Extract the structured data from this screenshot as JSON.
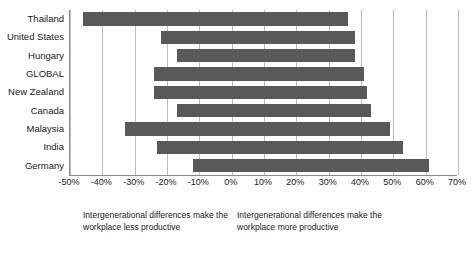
{
  "chart_data": {
    "type": "bar",
    "orientation": "horizontal",
    "title": "",
    "xlabel": "",
    "ylabel": "",
    "xlim": [
      -50,
      70
    ],
    "xtick_step": 10,
    "grid": true,
    "legend": "none",
    "bar_color": "#595959",
    "categories": [
      "Thailand",
      "United States",
      "Hungary",
      "GLOBAL",
      "New Zealand",
      "Canada",
      "Malaysia",
      "India",
      "Germany"
    ],
    "series": [
      {
        "name": "Intergenerational differences make the workplace less productive",
        "values": [
          -46,
          -22,
          -17,
          -24,
          -24,
          -17,
          -33,
          -23,
          -12
        ]
      },
      {
        "name": "Intergenerational differences make the workplace more productive",
        "values": [
          36,
          38,
          38,
          41,
          42,
          43,
          49,
          53,
          61
        ]
      }
    ],
    "bars": [
      {
        "category": "Thailand",
        "negative": -46,
        "positive": 36
      },
      {
        "category": "United States",
        "negative": -22,
        "positive": 38
      },
      {
        "category": "Hungary",
        "negative": -17,
        "positive": 38
      },
      {
        "category": "GLOBAL",
        "negative": -24,
        "positive": 41
      },
      {
        "category": "New Zealand",
        "negative": -24,
        "positive": 42
      },
      {
        "category": "Canada",
        "negative": -17,
        "positive": 43
      },
      {
        "category": "Malaysia",
        "negative": -33,
        "positive": 49
      },
      {
        "category": "India",
        "negative": -23,
        "positive": 53
      },
      {
        "category": "Germany",
        "negative": -12,
        "positive": 61
      }
    ],
    "xtick_labels": [
      "-50%",
      "-40%",
      "-30%",
      "-20%",
      "-10%",
      "0%",
      "10%",
      "20%",
      "30%",
      "40%",
      "50%",
      "60%",
      "70%"
    ],
    "xtick_values": [
      -50,
      -40,
      -30,
      -20,
      -10,
      0,
      10,
      20,
      30,
      40,
      50,
      60,
      70
    ],
    "annotations": [
      "Intergenerational differences make the workplace less productive",
      "Intergenerational differences make the workplace more productive"
    ]
  },
  "notes": {
    "left": "Intergenerational differences make the workplace less productive",
    "right": "Intergenerational differences make the workplace more productive"
  }
}
